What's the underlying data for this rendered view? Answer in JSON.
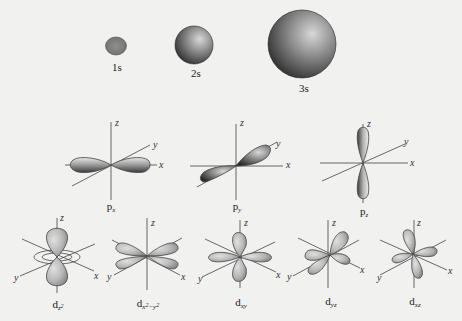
{
  "colors": {
    "background": "#f1f1ef",
    "orbital_light": "#c9c9c9",
    "orbital_dark": "#3a3a3a",
    "axis": "#444444"
  },
  "s_orbitals": [
    {
      "id": "1s",
      "label": "1s"
    },
    {
      "id": "2s",
      "label": "2s"
    },
    {
      "id": "3s",
      "label": "3s"
    }
  ],
  "p_orbitals": [
    {
      "id": "px",
      "label_main": "p",
      "label_sub": "x"
    },
    {
      "id": "py",
      "label_main": "p",
      "label_sub": "y"
    },
    {
      "id": "pz",
      "label_main": "p",
      "label_sub": "z"
    }
  ],
  "d_orbitals": [
    {
      "id": "dz2",
      "label_main": "d",
      "label_sub": "z",
      "label_sup": "2"
    },
    {
      "id": "dx2y2",
      "label_main": "d",
      "label_sub": "x",
      "label_sup": "2",
      "label_sub2": "−y",
      "label_sup2": "2"
    },
    {
      "id": "dxy",
      "label_main": "d",
      "label_sub": "xy"
    },
    {
      "id": "dyz",
      "label_main": "d",
      "label_sub": "yz"
    },
    {
      "id": "dxz",
      "label_main": "d",
      "label_sub": "xz"
    }
  ],
  "axes": {
    "x": "x",
    "y": "y",
    "z": "z"
  }
}
